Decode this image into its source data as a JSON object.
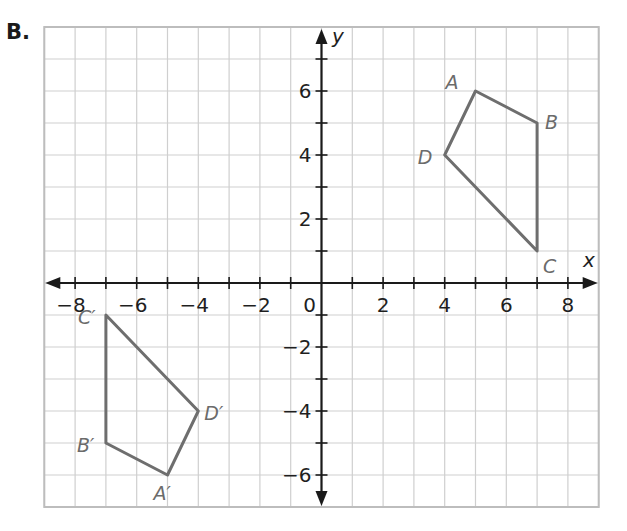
{
  "problem": {
    "label": "B."
  },
  "colors": {
    "grid": "#cfcfcf",
    "axis": "#1a1a1a",
    "polygon": "#6e6e6e",
    "vertex_label": "#6b6b6b"
  },
  "chart_data": {
    "type": "scatter",
    "title": "",
    "xlabel": "x",
    "ylabel": "y",
    "xlim": [
      -9,
      9
    ],
    "ylim": [
      -7,
      8
    ],
    "grid": true,
    "legend": null,
    "x_tick_labels": [
      "−8",
      "−6",
      "−4",
      "−2",
      "0",
      "2",
      "4",
      "6",
      "8"
    ],
    "x_tick_values": [
      -8,
      -6,
      -4,
      -2,
      0,
      2,
      4,
      6,
      8
    ],
    "y_tick_labels": [
      "6",
      "4",
      "2",
      "−2",
      "−4",
      "−6"
    ],
    "y_tick_values": [
      6,
      4,
      2,
      -2,
      -4,
      -6
    ],
    "series": [
      {
        "name": "ABCD",
        "closed": true,
        "points": [
          {
            "label": "A",
            "x": 5,
            "y": 6
          },
          {
            "label": "B",
            "x": 7,
            "y": 5
          },
          {
            "label": "C",
            "x": 7,
            "y": 1
          },
          {
            "label": "D",
            "x": 4,
            "y": 4
          }
        ]
      },
      {
        "name": "A′B′C′D′",
        "closed": true,
        "points": [
          {
            "label": "A′",
            "x": -5,
            "y": -6
          },
          {
            "label": "B′",
            "x": -7,
            "y": -5
          },
          {
            "label": "C′",
            "x": -7,
            "y": -1
          },
          {
            "label": "D′",
            "x": -4,
            "y": -4
          }
        ]
      }
    ]
  }
}
